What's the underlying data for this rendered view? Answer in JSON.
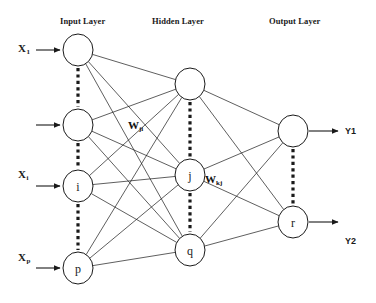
{
  "diagram": {
    "width": 376,
    "height": 303,
    "background": "#ffffff",
    "stroke_color": "#1a1a1a",
    "node_fill": "#ffffff"
  },
  "layer_titles": [
    {
      "key": "input",
      "label": "Input Layer",
      "x": 60,
      "y": 16
    },
    {
      "key": "hidden",
      "label": "Hidden Layer",
      "x": 152,
      "y": 16
    },
    {
      "key": "output",
      "label": "Output Layer",
      "x": 269,
      "y": 16
    }
  ],
  "nodes": {
    "input": [
      {
        "id": "in-1",
        "label": "",
        "cx": 78,
        "cy": 50
      },
      {
        "id": "in-2",
        "label": "",
        "cx": 78,
        "cy": 125
      },
      {
        "id": "in-i",
        "label": "i",
        "cx": 78,
        "cy": 186
      },
      {
        "id": "in-p",
        "label": "p",
        "cx": 78,
        "cy": 268
      }
    ],
    "hidden": [
      {
        "id": "hid-1",
        "label": "",
        "cx": 190,
        "cy": 84
      },
      {
        "id": "hid-j",
        "label": "j",
        "cx": 190,
        "cy": 175
      },
      {
        "id": "hid-q",
        "label": "q",
        "cx": 190,
        "cy": 250
      }
    ],
    "output": [
      {
        "id": "out-1",
        "label": "",
        "cx": 293,
        "cy": 131
      },
      {
        "id": "out-r",
        "label": "r",
        "cx": 293,
        "cy": 222
      }
    ]
  },
  "node_radius": {
    "rx": 15,
    "ry": 16
  },
  "input_labels": [
    {
      "id": "x1",
      "base": "X",
      "sub": "1",
      "x": 18,
      "y": 42,
      "has_arrow": true,
      "arrow_y": 50
    },
    {
      "id": "x2",
      "base": "",
      "sub": "",
      "x": 18,
      "y": 117,
      "has_arrow": true,
      "arrow_y": 125
    },
    {
      "id": "xi",
      "base": "X",
      "sub": "i",
      "x": 18,
      "y": 168,
      "has_arrow": true,
      "arrow_y": 186
    },
    {
      "id": "xp",
      "base": "X",
      "sub": "p",
      "x": 18,
      "y": 251,
      "has_arrow": true,
      "arrow_y": 268
    }
  ],
  "output_labels": [
    {
      "id": "y1",
      "label": "Y1",
      "x": 345,
      "y": 126,
      "arrow_y": 131
    },
    {
      "id": "y2",
      "label": "Y2",
      "x": 345,
      "y": 236,
      "arrow_y": 222
    }
  ],
  "weight_labels": [
    {
      "id": "wji",
      "base": "W",
      "sub": "ji",
      "x": 128,
      "y": 119
    },
    {
      "id": "wkj",
      "base": "W",
      "sub": "kj",
      "x": 205,
      "y": 173
    }
  ],
  "ellipsis_connectors": [
    {
      "id": "ell-in-1",
      "x": 78,
      "y1": 68,
      "y2": 107
    },
    {
      "id": "ell-in-2",
      "x": 78,
      "y1": 143,
      "y2": 168
    },
    {
      "id": "ell-in-3",
      "x": 78,
      "y1": 204,
      "y2": 250
    },
    {
      "id": "ell-hid-1",
      "x": 190,
      "y1": 102,
      "y2": 157
    },
    {
      "id": "ell-hid-2",
      "x": 190,
      "y1": 193,
      "y2": 232
    },
    {
      "id": "ell-out-1",
      "x": 293,
      "y1": 149,
      "y2": 204
    }
  ],
  "chart_data": {
    "type": "diagram",
    "subtype": "neural-network-graph",
    "layers": [
      {
        "name": "Input Layer",
        "node_count": 4,
        "node_labels": [
          "",
          "",
          "i",
          "p"
        ]
      },
      {
        "name": "Hidden Layer",
        "node_count": 3,
        "node_labels": [
          "",
          "j",
          "q"
        ]
      },
      {
        "name": "Output Layer",
        "node_count": 2,
        "node_labels": [
          "",
          "r"
        ]
      }
    ],
    "inputs": [
      "X1",
      "Xi",
      "Xp"
    ],
    "outputs": [
      "Y1",
      "Y2"
    ],
    "weights": [
      "Wji",
      "Wkj"
    ],
    "connectivity": "fully-connected between adjacent layers"
  }
}
